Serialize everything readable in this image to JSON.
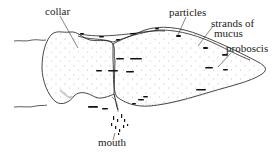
{
  "figure": {
    "labels": {
      "collar": "collar",
      "particles": "particles",
      "strands_line1": "strands of",
      "strands_line2": "mucus",
      "proboscis": "proboscis",
      "mouth": "mouth"
    },
    "colors": {
      "ink": "#222222",
      "background": "#ffffff"
    }
  }
}
